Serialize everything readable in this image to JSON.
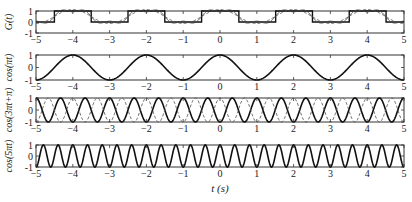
{
  "chart_data": [
    {
      "type": "line",
      "panel": 1,
      "ylabel": "G(t)",
      "xlim": [
        -5,
        5
      ],
      "ylim": [
        -1,
        1
      ],
      "yticks": [
        "1",
        "0",
        "-1"
      ],
      "xticks": [
        "-5",
        "-4",
        "-3",
        "-2",
        "-1",
        "0",
        "1",
        "2",
        "3",
        "4",
        "5"
      ],
      "series": [
        {
          "name": "square wave G(t)",
          "style": "solid",
          "period": 2,
          "high": 1,
          "low": 0,
          "description": "0.5 + 0.5*sign(cos(pi t))"
        },
        {
          "name": "Fourier approx (1 harmonic)",
          "style": "dashed",
          "description": "0.5 + (2/pi)cos(pi t)"
        },
        {
          "name": "Fourier approx (2 harmonics)",
          "style": "solid-thin",
          "description": "0.5 + (2/pi)cos(pi t) - (2/(3pi))cos(3pi t)"
        }
      ]
    },
    {
      "type": "line",
      "panel": 2,
      "ylabel": "cos(πt)",
      "xlim": [
        -5,
        5
      ],
      "ylim": [
        -1,
        1
      ],
      "yticks": [
        "1",
        "0",
        "-1"
      ],
      "xticks": [
        "-5",
        "-4",
        "-3",
        "-2",
        "-1",
        "0",
        "1",
        "2",
        "3",
        "4",
        "5"
      ],
      "series": [
        {
          "name": "cos(pi t)",
          "style": "solid",
          "frequency": 0.5
        }
      ]
    },
    {
      "type": "line",
      "panel": 3,
      "ylabel": "cos(3πt+π)",
      "xlim": [
        -5,
        5
      ],
      "ylim": [
        -1,
        1
      ],
      "yticks": [
        "1",
        "0",
        "-1"
      ],
      "xticks": [
        "-5",
        "-4",
        "-3",
        "-2",
        "-1",
        "0",
        "1",
        "2",
        "3",
        "4",
        "5"
      ],
      "series": [
        {
          "name": "cos(3pi t + pi)",
          "style": "solid",
          "frequency": 1.5
        },
        {
          "name": "cos(3pi t)",
          "style": "dashed",
          "frequency": 1.5
        }
      ]
    },
    {
      "type": "line",
      "panel": 4,
      "ylabel": "cos(5πt)",
      "xlim": [
        -5,
        5
      ],
      "ylim": [
        -1,
        1
      ],
      "yticks": [
        "1",
        "0",
        "-1"
      ],
      "xticks": [
        "-5",
        "-4",
        "-3",
        "-2",
        "-1",
        "0",
        "1",
        "2",
        "3",
        "4",
        "5"
      ],
      "xlabel": "t (s)",
      "series": [
        {
          "name": "cos(5pi t)",
          "style": "solid",
          "frequency": 2.5
        }
      ]
    }
  ],
  "labels": {
    "panel1_ylabel": "G(t)",
    "panel2_ylabel": "cos(πt)",
    "panel3_ylabel": "cos(3πt+π)",
    "panel4_ylabel": "cos(5πt)",
    "xlabel": "t (s)",
    "ytick_top": "1",
    "ytick_mid": "0",
    "ytick_bot": "-1"
  }
}
